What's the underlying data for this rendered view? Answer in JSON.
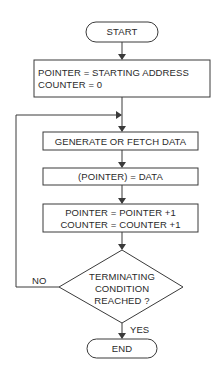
{
  "diagram": {
    "type": "flowchart",
    "colors": {
      "line": "#3a3a3a",
      "text": "#2a2a2a",
      "background": "#ffffff"
    },
    "nodes": {
      "start": {
        "shape": "terminal",
        "label": "START"
      },
      "init": {
        "shape": "process",
        "line1": "POINTER = STARTING ADDRESS",
        "line2": "COUNTER = 0"
      },
      "generate": {
        "shape": "process",
        "label": "GENERATE OR FETCH DATA"
      },
      "store": {
        "shape": "process",
        "label": "(POINTER) = DATA"
      },
      "increment": {
        "shape": "process",
        "line1": "POINTER = POINTER +1",
        "line2": "COUNTER = COUNTER +1"
      },
      "decision": {
        "shape": "decision",
        "line1": "TERMINATING",
        "line2": "CONDITION",
        "line3": "REACHED ?"
      },
      "end": {
        "shape": "terminal",
        "label": "END"
      }
    },
    "edges": {
      "no_label": "NO",
      "yes_label": "YES"
    }
  }
}
